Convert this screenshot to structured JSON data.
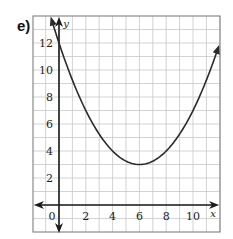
{
  "part_label": "e)",
  "chart_data": {
    "type": "line",
    "title": "",
    "xlabel": "x",
    "ylabel": "y",
    "xlim": [
      -2,
      12
    ],
    "ylim": [
      -2,
      14
    ],
    "grid": true,
    "x_ticks": [
      0,
      2,
      4,
      6,
      8,
      10
    ],
    "x_tick_labels": [
      "0",
      "2",
      "4",
      "6",
      "8",
      "10"
    ],
    "y_ticks": [
      2,
      4,
      6,
      8,
      10,
      12
    ],
    "y_tick_labels": [
      "2",
      "4",
      "6",
      "8",
      "10",
      "12"
    ],
    "series": [
      {
        "name": "parabola",
        "equation": "y = 0.25(x - 6)^2 + 3",
        "vertex": [
          6,
          3
        ],
        "x": [
          -0.6,
          0,
          1,
          2,
          3,
          4,
          5,
          6,
          7,
          8,
          9,
          10,
          11,
          12
        ],
        "values": [
          13.89,
          12,
          9.25,
          7,
          5.25,
          4,
          3.25,
          3,
          3.25,
          4,
          5.25,
          7,
          9.25,
          12
        ],
        "arrows_at_ends": true
      }
    ],
    "axes_arrows": true
  },
  "colors": {
    "grid": "#c8c8c8",
    "border": "#8a8a8a",
    "axis": "#1a1a1a",
    "curve": "#2a2a2a",
    "text": "#222222"
  }
}
